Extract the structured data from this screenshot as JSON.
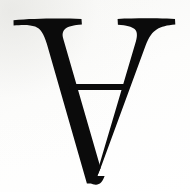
{
  "image": {
    "kind": "scanned-character-specimen",
    "character": "Ɐ",
    "character_name": "turned-capital-a",
    "unicode": "U+2C6F",
    "description": "Turned capital letter A in a serif typeface, black ink on off-white scanned paper",
    "alt_text": "Black serif turned capital A glyph",
    "orientation": "upside-down",
    "style": "serif",
    "width": 190,
    "height": 192
  },
  "colors": {
    "ink": "#0b0b0b",
    "ink_soft": "#141414",
    "paper": "#fbfbfa",
    "paper_warm": "#f7f7f5",
    "paper_white": "#ffffff"
  },
  "glyph_parts": {
    "left_serif": "left-top-serif",
    "right_serif": "right-top-serif",
    "thick_stroke": "left-thick-diagonal-stroke",
    "thin_stroke": "right-thin-diagonal-stroke",
    "crossbar": "horizontal-crossbar",
    "apex": "bottom-apex-point"
  },
  "geometry": {
    "left_serif_x_start": 13,
    "left_serif_x_end": 82,
    "right_serif_x_start": 117,
    "right_serif_x_end": 175,
    "serif_top_y": 19,
    "crossbar_y": 86,
    "crossbar_thickness": 5,
    "crossbar_x_start": 70,
    "crossbar_x_end": 126,
    "apex_x": 95,
    "apex_y": 183
  }
}
